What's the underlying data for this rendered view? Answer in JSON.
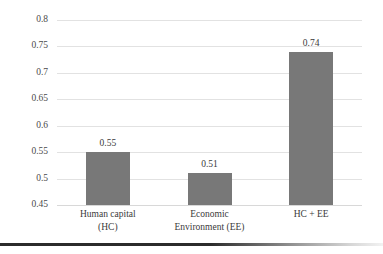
{
  "chart_data": {
    "type": "bar",
    "title": "",
    "subtitle": "",
    "xlabel": "",
    "ylabel": "",
    "categories": [
      "Human capital (HC)",
      "Economic Environment (EE)",
      "HC + EE"
    ],
    "category_lines": [
      [
        "Human capital",
        "(HC)"
      ],
      [
        "Economic",
        "Environment (EE)"
      ],
      [
        "HC + EE"
      ]
    ],
    "values": [
      0.55,
      0.51,
      0.74
    ],
    "value_labels": [
      "0.55",
      "0.51",
      "0.74"
    ],
    "ylim": [
      0.45,
      0.8
    ],
    "ytick_values": [
      0.8,
      0.75,
      0.7,
      0.65,
      0.6,
      0.55,
      0.5,
      0.45
    ],
    "ytick_labels": [
      "0.8",
      "0.75",
      "0.7",
      "0.65",
      "0.6",
      "0.55",
      "0.5",
      "0.45"
    ],
    "grid": true,
    "grid_axis": "y",
    "legend": false,
    "legend_position": "none",
    "series": [
      {
        "name": "value",
        "values": [
          0.55,
          0.51,
          0.74
        ]
      }
    ]
  },
  "style": {
    "bar_color": "#787878",
    "gridline_color": "#e2e2e2",
    "baseline_color": "#d8d8d8",
    "text_color": "#3a3a3a",
    "tick_text_color": "#4a4a4a",
    "background": "#ffffff",
    "rule_color": "#2b2b2b"
  }
}
